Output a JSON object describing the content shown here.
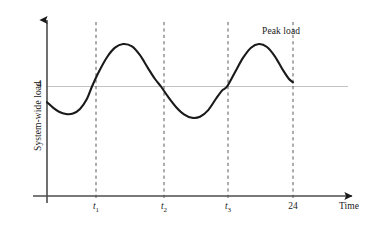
{
  "figure": {
    "title": "",
    "background_color": "#ffffff",
    "curve_color": "#1a1a1a",
    "axis_color": "#595959",
    "reference_line_color": "#bfbfbf",
    "dashed_line_color": "#595959",
    "text_color": "#1a1a1a"
  },
  "axes": {
    "y_label": "System-wide load",
    "x_label": "Time",
    "y_ticks": [
      {
        "label": "4",
        "value": 4
      }
    ],
    "x_ticks": [
      {
        "label": "t",
        "subscript": "1",
        "value": "t1"
      },
      {
        "label": "t",
        "subscript": "2",
        "value": "t2"
      },
      {
        "label": "t",
        "subscript": "3",
        "value": "t3"
      },
      {
        "label": "24",
        "subscript": "",
        "value": "24"
      }
    ]
  },
  "annotations": [
    {
      "label": "Peak load"
    }
  ],
  "chart_data": {
    "type": "line",
    "title": "",
    "xlabel": "Time",
    "ylabel": "System-wide load",
    "xlim": [
      0,
      26
    ],
    "ylim": [
      0,
      8
    ],
    "grid": false,
    "legend": "none",
    "reference_lines": [
      {
        "axis": "y",
        "value": 4,
        "label": "4",
        "style": "solid",
        "color": "#bfbfbf"
      }
    ],
    "vertical_markers": [
      {
        "label": "t1",
        "x": 4.5,
        "style": "dashed"
      },
      {
        "label": "t2",
        "x": 11.4,
        "style": "dashed"
      },
      {
        "label": "t3",
        "x": 18.0,
        "style": "dashed"
      },
      {
        "label": "24",
        "x": 24.6,
        "style": "dashed"
      }
    ],
    "annotations": [
      {
        "text": "Peak load",
        "x": 22.5,
        "y": 7.4
      }
    ],
    "series": [
      {
        "name": "System-wide load",
        "x": [
          0.0,
          0.6,
          1.2,
          1.9,
          2.6,
          3.3,
          4.0,
          4.5,
          5.2,
          6.0,
          6.8,
          7.6,
          8.5,
          9.3,
          10.1,
          10.8,
          11.4,
          12.1,
          12.9,
          13.7,
          14.5,
          15.3,
          16.1,
          16.9,
          17.5,
          18.0,
          18.8,
          19.6,
          20.4,
          21.2,
          22.0,
          22.8,
          23.6,
          24.2,
          24.6
        ],
        "y": [
          2.85,
          2.45,
          2.15,
          1.98,
          2.02,
          2.35,
          3.1,
          4.0,
          5.1,
          6.15,
          6.85,
          7.12,
          6.95,
          6.3,
          5.35,
          4.55,
          4.0,
          3.25,
          2.5,
          1.95,
          1.7,
          1.78,
          2.25,
          3.1,
          3.7,
          4.0,
          5.05,
          6.1,
          6.85,
          7.12,
          6.9,
          6.2,
          5.2,
          4.55,
          4.3
        ]
      }
    ]
  }
}
